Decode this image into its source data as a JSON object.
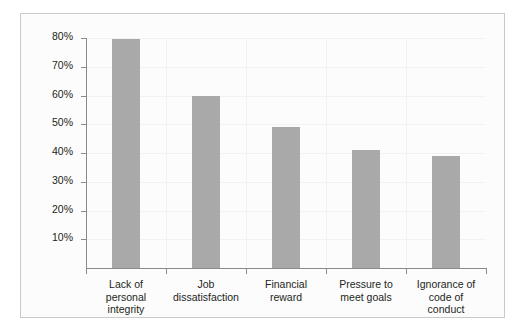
{
  "chart_data": {
    "type": "bar",
    "title": "",
    "subtitle": "",
    "xlabel": "",
    "ylabel": "",
    "categories": [
      "Lack of\npersonal\nintegrity",
      "Job\ndissatisfaction",
      "Financial\nreward",
      "Pressure to\nmeet goals",
      "Ignorance of\ncode of\nconduct"
    ],
    "values": [
      79.5,
      60,
      49,
      41,
      39
    ],
    "value_labels": [
      "79.5%",
      "60%",
      "49%",
      "41%",
      "39%"
    ],
    "ylim": [
      0,
      80
    ],
    "y_ticks": [
      10,
      20,
      30,
      40,
      50,
      60,
      70,
      80
    ],
    "y_tick_labels": [
      "10%",
      "20%",
      "30%",
      "40%",
      "50%",
      "60%",
      "70%",
      "80%"
    ],
    "grid": false,
    "legend": null,
    "legend_position": "none",
    "bar_color": "#a9a9a9",
    "axis_color": "#8a8a8a",
    "text_color": "#231f20",
    "plot_background": "#fcfcfc",
    "panel_border_color": "#c9c9c9"
  }
}
